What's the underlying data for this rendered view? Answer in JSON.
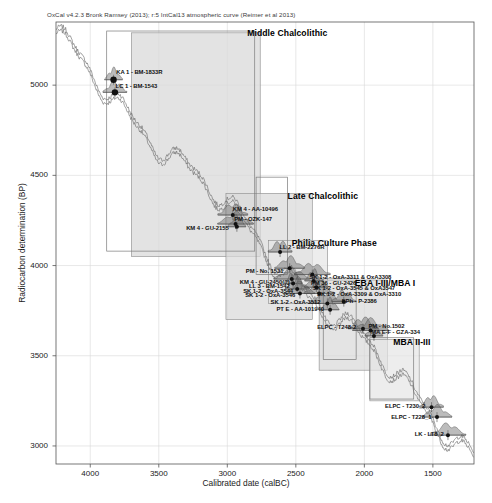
{
  "figure": {
    "header_note": "OxCal v4.2.3 Bronk Ramsey (2013); r:5 IntCal13 atmospheric curve (Reimer et al 2013)",
    "axis_x_label": "Calibrated date (calBC)",
    "axis_y_label": "Radiocarbon determination (BP)"
  },
  "chart_data": {
    "type": "scatter",
    "title": "",
    "xlabel": "Calibrated date (calBC)",
    "ylabel": "Radiocarbon determination (BP)",
    "xlim": [
      4250,
      1200
    ],
    "ylim": [
      2900,
      5350
    ],
    "x_ticks": [
      "4000",
      "3500",
      "3000",
      "2500",
      "2000",
      "1500"
    ],
    "x_tick_values": [
      4000,
      3500,
      3000,
      2500,
      2000,
      1500
    ],
    "y_ticks": [
      "5000",
      "4500",
      "4000",
      "3500",
      "3000"
    ],
    "y_tick_values": [
      5000,
      4500,
      4000,
      3500,
      3000
    ],
    "grid": true,
    "legend": "none",
    "calibration_curve": "IntCal13 atmospheric curve",
    "periods": [
      {
        "name": "Middle Chalcolithic",
        "label_x": 2855,
        "label_y": 5285,
        "box_x0": 3700,
        "box_x1": 2760,
        "box_y0": 5290,
        "box_y1": 4050
      },
      {
        "name": "Late Chalcolithic",
        "label_x": 2560,
        "label_y": 4380,
        "box_x0": 3010,
        "box_x1": 2380,
        "box_y0": 4400,
        "box_y1": 3700
      },
      {
        "name": "Philia Culture Phase",
        "label_x": 2530,
        "label_y": 4120,
        "box_x0": 2700,
        "box_x1": 2270,
        "box_y0": 4140,
        "box_y1": 3790
      },
      {
        "name": "EBA I-III/MBA I",
        "label_x": 2070,
        "label_y": 3900,
        "box_x0": 2330,
        "box_x1": 1830,
        "box_y0": 3920,
        "box_y1": 3420
      },
      {
        "name": "MBA II-III",
        "label_x": 1790,
        "label_y": 3570,
        "box_x0": 1960,
        "box_x1": 1600,
        "box_y0": 3590,
        "box_y1": 3250
      }
    ],
    "samples": [
      {
        "label": "KA 1 - BM-1833R",
        "align": "left",
        "x": 3830,
        "y": 5030,
        "lx": 3810,
        "ly": 5070
      },
      {
        "label": "LC 1 - BM-1543",
        "align": "left",
        "x": 3820,
        "y": 4960,
        "lx": 3815,
        "ly": 4990
      },
      {
        "label": "KM 4 - AA-10496",
        "align": "left",
        "x": 2960,
        "y": 4280,
        "lx": 2960,
        "ly": 4310
      },
      {
        "label": "PM - OZK-147",
        "align": "left",
        "x": 2940,
        "y": 4230,
        "lx": 2950,
        "ly": 4255
      },
      {
        "label": "KM 4 - GU-2155",
        "align": "right",
        "x": 2930,
        "y": 4215,
        "lx": 2990,
        "ly": 4205
      },
      {
        "label": "LL 2 - BM-2276R",
        "align": "left",
        "x": 2615,
        "y": 4075,
        "lx": 2620,
        "ly": 4095
      },
      {
        "label": "PM - No. 1531",
        "align": "right",
        "x": 2545,
        "y": 3985,
        "lx": 2590,
        "ly": 3965
      },
      {
        "label": "KM 4 - GU-2450(?)",
        "align": "right",
        "x": 2530,
        "y": 3925,
        "lx": 2545,
        "ly": 3905
      },
      {
        "label": "LL 3 - BM-1542",
        "align": "right",
        "x": 2520,
        "y": 3900,
        "lx": 2545,
        "ly": 3880
      },
      {
        "label": "SK 1-2 - OxA-3544",
        "align": "right",
        "x": 2490,
        "y": 3870,
        "lx": 2520,
        "ly": 3855
      },
      {
        "label": "SK 1-2 - OxA-3546",
        "align": "right",
        "x": 2470,
        "y": 3845,
        "lx": 2505,
        "ly": 3830
      },
      {
        "label": "SK 1-2 - OxA-3311 & OxA3308",
        "align": "left",
        "x": 2380,
        "y": 3950,
        "lx": 2400,
        "ly": 3930
      },
      {
        "label": "PM 36 - GU-2426",
        "align": "left",
        "x": 2370,
        "y": 3915,
        "lx": 2390,
        "ly": 3900
      },
      {
        "label": "SK 1-2 - OxA-3545 & OxA3547",
        "align": "left",
        "x": 2350,
        "y": 3880,
        "lx": 2375,
        "ly": 3870
      },
      {
        "label": "SK 1-2 - OxA-3309 & OxA-3310",
        "align": "left",
        "x": 2330,
        "y": 3845,
        "lx": 2345,
        "ly": 3835
      },
      {
        "label": "SK 1-2 - OxA-3512",
        "align": "right",
        "x": 2270,
        "y": 3790,
        "lx": 2320,
        "ly": 3790
      },
      {
        "label": "PT E - AA-101940",
        "align": "right",
        "x": 2250,
        "y": 3755,
        "lx": 2295,
        "ly": 3755
      },
      {
        "label": "EPh - P-2386",
        "align": "left",
        "x": 2150,
        "y": 3800,
        "lx": 2165,
        "ly": 3800
      },
      {
        "label": "ELPC - T248-2",
        "align": "right",
        "x": 2010,
        "y": 3650,
        "lx": 2060,
        "ly": 3655
      },
      {
        "label": "PM - No.1502",
        "align": "left",
        "x": 1955,
        "y": 3640,
        "lx": 1970,
        "ly": 3660
      },
      {
        "label": "MA E-F - GZA-334",
        "align": "left",
        "x": 1930,
        "y": 3610,
        "lx": 1950,
        "ly": 3625
      },
      {
        "label": "ELPC - T230_2",
        "align": "right",
        "x": 1510,
        "y": 3215,
        "lx": 1555,
        "ly": 3215
      },
      {
        "label": "ELPC - T228_1",
        "align": "right",
        "x": 1470,
        "y": 3160,
        "lx": 1510,
        "ly": 3155
      },
      {
        "label": "LK - LT8_2",
        "align": "right",
        "x": 1390,
        "y": 3060,
        "lx": 1420,
        "ly": 3060
      }
    ]
  }
}
